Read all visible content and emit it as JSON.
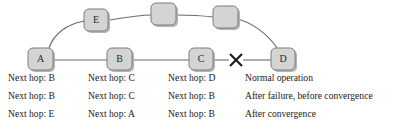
{
  "figure": {
    "type": "network-routing-diagram",
    "colors": {
      "node_fill": "#d4d4d4",
      "node_stroke": "#7d7d7d",
      "node_shadow": "#b4b4b4",
      "edge": "#6b6b6b",
      "failure_mark": "#1e1e1e",
      "text": "#1a1a1a",
      "background": "#ffffff"
    }
  },
  "topology": {
    "bottom_row_nodes": [
      {
        "id": "A",
        "label": "A",
        "cx": 41,
        "cy": 60
      },
      {
        "id": "B",
        "label": "B",
        "cx": 120,
        "cy": 60
      },
      {
        "id": "C",
        "label": "C",
        "cx": 201,
        "cy": 60
      },
      {
        "id": "D",
        "label": "D",
        "cx": 283,
        "cy": 60
      }
    ],
    "top_row_nodes": [
      {
        "id": "E",
        "label": "E",
        "cx": 97,
        "cy": 21
      },
      {
        "id": "N1",
        "label": "",
        "cx": 163,
        "cy": 15
      },
      {
        "id": "N2",
        "label": "",
        "cx": 225,
        "cy": 17
      }
    ],
    "links": [
      {
        "from": "A",
        "to": "B",
        "shape": "straight"
      },
      {
        "from": "B",
        "to": "C",
        "shape": "straight"
      },
      {
        "from": "C",
        "to": "D",
        "shape": "straight",
        "failed": true
      },
      {
        "from": "A",
        "to": "E",
        "shape": "curve"
      },
      {
        "from": "E",
        "to": "N1",
        "shape": "curve"
      },
      {
        "from": "N1",
        "to": "N2",
        "shape": "curve"
      },
      {
        "from": "N2",
        "to": "D",
        "shape": "curve"
      }
    ],
    "failure_mark": {
      "name": "link-failure-x",
      "glyph": "X",
      "cx": 236,
      "cy": 60,
      "between": [
        "C",
        "D"
      ]
    }
  },
  "routing_table": {
    "columns_x": [
      8,
      88,
      168,
      245
    ],
    "rows_y": [
      81,
      99,
      117
    ],
    "rows": [
      {
        "node_a": "Next hop: B",
        "node_b": "Next hop: C",
        "node_c": "Next hop: D",
        "scenario": "Normal operation"
      },
      {
        "node_a": "Next hop: B",
        "node_b": "Next hop: C",
        "node_c": "Next hop: B",
        "scenario": "After failure, before convergence"
      },
      {
        "node_a": "Next hop: E",
        "node_b": "Next hop: A",
        "node_c": "Next hop: B",
        "scenario": "After convergence"
      }
    ]
  }
}
